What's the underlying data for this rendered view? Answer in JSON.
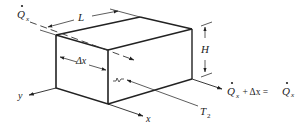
{
  "diagram": {
    "type": "control-volume-box",
    "labels": {
      "q_in": "Q",
      "q_in_sub": "x",
      "length": "L",
      "height": "H",
      "slice": "Δx",
      "y_axis": "y",
      "x_axis": "x",
      "temp": "T",
      "temp_sub": "2",
      "eq_q": "Q",
      "eq_sub": "x",
      "eq_mid": " + Δx = ",
      "eq_q2": "Q",
      "eq_sub2": "x"
    },
    "colors": {
      "line": "#222222",
      "background": "#ffffff"
    }
  }
}
